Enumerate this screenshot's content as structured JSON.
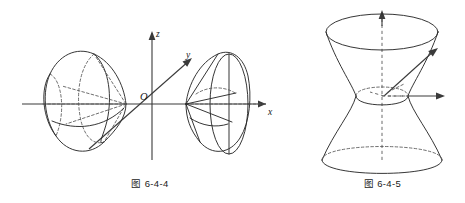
{
  "page": {
    "background_color": "#ffffff",
    "ink_color": "#2b2b2b",
    "width": 465,
    "height": 203
  },
  "figures": [
    {
      "id": "fig-6-4-4",
      "caption": "图 6-4-4",
      "subject": "hyperboloid-of-two-sheets",
      "axes": {
        "x_label": "x",
        "y_label": "y",
        "z_label": "z",
        "origin_label": "O"
      }
    },
    {
      "id": "fig-6-4-5",
      "caption": "图 6-4-5",
      "subject": "hyperboloid-of-one-sheet",
      "axes": {
        "x_label": "x",
        "y_label": "y",
        "z_label": "z",
        "origin_label": "O"
      }
    }
  ]
}
